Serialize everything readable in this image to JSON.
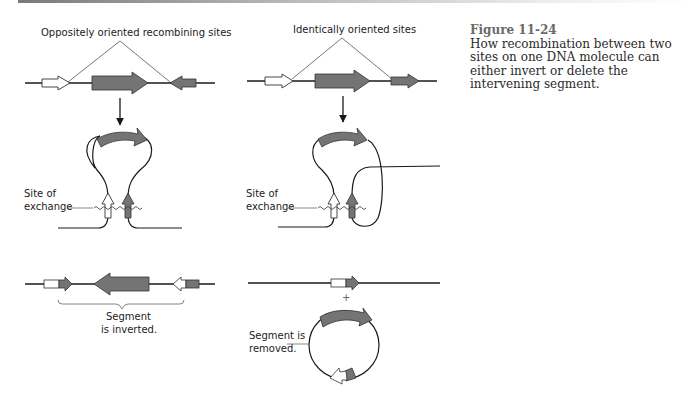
{
  "figure": {
    "number": "Figure 11-24",
    "caption": "How recombination between two sites on one DNA molecule can either invert or delete the intervening segment."
  },
  "left_panel": {
    "title": "Oppositely oriented recombining sites",
    "exchange_label_line1": "Site of",
    "exchange_label_line2": "exchange",
    "result_label_line1": "Segment",
    "result_label_line2": "is inverted."
  },
  "right_panel": {
    "title": "Identically oriented sites",
    "exchange_label_line1": "Site of",
    "exchange_label_line2": "exchange",
    "plus_sign": "+",
    "result_label_line1": "Segment is",
    "result_label_line2": "removed."
  },
  "colors": {
    "segment_fill": "#747474",
    "site_open_fill": "#ffffff",
    "line": "#1a1a1a"
  }
}
